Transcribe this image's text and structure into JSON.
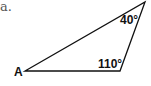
{
  "problem": {
    "item_label": "a."
  },
  "triangle": {
    "vertices": {
      "A": {
        "label": "A",
        "x": 25,
        "y": 71
      },
      "B": {
        "label": "",
        "x": 145,
        "y": 2
      },
      "C": {
        "label": "",
        "x": 120,
        "y": 71
      }
    },
    "angles": {
      "top": "40°",
      "bottom_right": "110°"
    },
    "stroke_color": "#111111"
  }
}
